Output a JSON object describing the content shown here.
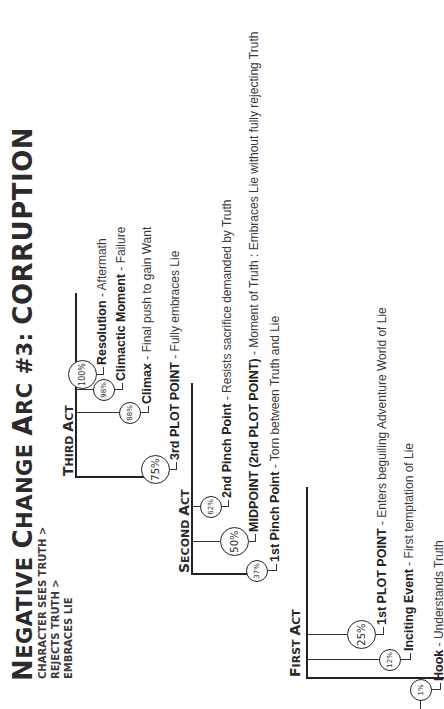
{
  "title": {
    "first_cap_1": "N",
    "rest_1": "EGATIVE ",
    "first_cap_2": "C",
    "rest_2": "HANGE ",
    "first_cap_3": "A",
    "rest_3": "RC #3: ",
    "last": "CORRUPTION"
  },
  "subtitle": {
    "line1": "CHARACTER SEES TRUTH >",
    "line2": "REJECTS TRUTH >",
    "line3": "EMBRACES LIE"
  },
  "acts": [
    {
      "cap": "F",
      "rest": "IRST ",
      "cap2": "A",
      "rest2": "CT",
      "beats": [
        {
          "percent": "1%",
          "name": "Hook",
          "desc": " - Understands Truth"
        },
        {
          "percent": "12%",
          "name": "Inciting Event",
          "desc": " - First temptation of Lie"
        },
        {
          "percent": "25%",
          "name": "1st PLOT POINT",
          "desc": " - Enters beguiling Adventure World of Lie"
        }
      ]
    },
    {
      "cap": "S",
      "rest": "ECOND ",
      "cap2": "A",
      "rest2": "CT",
      "beats": [
        {
          "percent": "37%",
          "name": "1st Pinch Point",
          "desc": " - Torn between Truth and Lie"
        },
        {
          "percent": "50%",
          "name": "MIDPOINT (2nd PLOT POINT)",
          "desc": " - Moment of Truth : Embraces Lie without fully rejecting Truth"
        },
        {
          "percent": "62%",
          "name": "2nd Pinch Point",
          "desc": " - Resists sacrifice demanded by Truth"
        }
      ]
    },
    {
      "cap": "T",
      "rest": "HIRD ",
      "cap2": "A",
      "rest2": "CT",
      "beats": [
        {
          "percent": "75%",
          "name": "3rd PLOT POINT",
          "desc": " - Fully embraces Lie"
        },
        {
          "percent": "88%",
          "name": "Climax",
          "desc": " - Final push to gain Want"
        },
        {
          "percent": "98%",
          "name": "Climactic Moment",
          "desc": " - Failure"
        },
        {
          "percent": "100%",
          "name": "Resolution",
          "desc": " - Aftermath"
        }
      ]
    }
  ]
}
